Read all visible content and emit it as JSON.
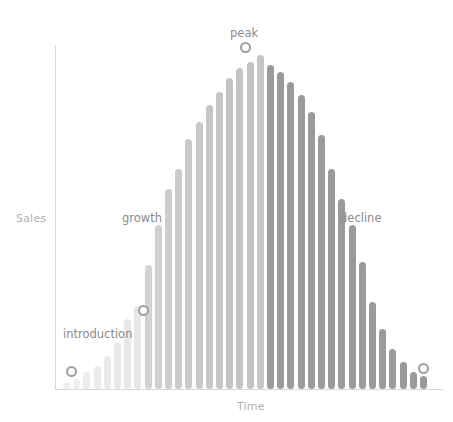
{
  "chart_data": {
    "type": "bar",
    "title": "",
    "subtitle": "",
    "xlabel": "Time",
    "ylabel": "Sales",
    "grid": false,
    "legend": "none",
    "xlim": [
      0,
      36
    ],
    "ylim": [
      0,
      100
    ],
    "categories": [
      "1",
      "2",
      "3",
      "4",
      "5",
      "6",
      "7",
      "8",
      "9",
      "10",
      "11",
      "12",
      "13",
      "14",
      "15",
      "16",
      "17",
      "18",
      "19",
      "20",
      "21",
      "22",
      "23",
      "24",
      "25",
      "26",
      "27",
      "28",
      "29",
      "30",
      "31",
      "32",
      "33",
      "34",
      "35",
      "36"
    ],
    "values": [
      2,
      3,
      5,
      7,
      10,
      14,
      21,
      25,
      37,
      49,
      60,
      66,
      75,
      80,
      85,
      89,
      93,
      96,
      98,
      100,
      97,
      95,
      92,
      88,
      83,
      76,
      66,
      57,
      49,
      38,
      26,
      18,
      12,
      8,
      5,
      4
    ],
    "bar_colors": [
      "#efefef",
      "#eeeeee",
      "#ededed",
      "#ececec",
      "#eaeaea",
      "#e9e9e9",
      "#e8e8e8",
      "#e7e7e7",
      "#d3d3d3",
      "#cfcfcf",
      "#cdcdcd",
      "#cbcbcb",
      "#c9c9c9",
      "#c8c8c8",
      "#c6c6c6",
      "#c5c5c5",
      "#c4c4c4",
      "#c3c3c3",
      "#c2c2c2",
      "#c6c6c6",
      "#9a9a9a",
      "#9a9a9a",
      "#9a9a9a",
      "#9a9a9a",
      "#9a9a9a",
      "#9a9a9a",
      "#9a9a9a",
      "#9a9a9a",
      "#9a9a9a",
      "#9a9a9a",
      "#9a9a9a",
      "#9a9a9a",
      "#9a9a9a",
      "#9a9a9a",
      "#9a9a9a",
      "#9a9a9a"
    ],
    "annotations": [
      {
        "id": "introduction",
        "label": "introduction",
        "marker_index": 0,
        "marker_value": 2
      },
      {
        "id": "growth",
        "label": "growth",
        "marker_index": 8,
        "marker_value": 37
      },
      {
        "id": "peak",
        "label": "peak",
        "marker_index": 19,
        "marker_value": 100
      },
      {
        "id": "decline",
        "label": "decline",
        "marker_index": 35,
        "marker_value": 4
      }
    ],
    "colors": {
      "axis": "#d8d8d8",
      "axis_label": "#b0b0b0",
      "annotation_label": "#8a8a8a",
      "marker_stroke": "#9e9e9e",
      "marker_fill": "#ffffff",
      "bar_light": "#efefef",
      "bar_mid": "#c6c6c6",
      "bar_dark": "#9a9a9a",
      "background": "#ffffff"
    },
    "geometry": {
      "plot_left": 63,
      "plot_bottom": 389,
      "plot_top": 55,
      "bar_width": 7,
      "bar_step": 10.2,
      "max_bar_height": 334
    }
  },
  "axes": {
    "y_label": "Sales",
    "x_label": "Time"
  },
  "annotations": {
    "introduction": "introduction",
    "growth": "growth",
    "peak": "peak",
    "decline": "decline"
  }
}
